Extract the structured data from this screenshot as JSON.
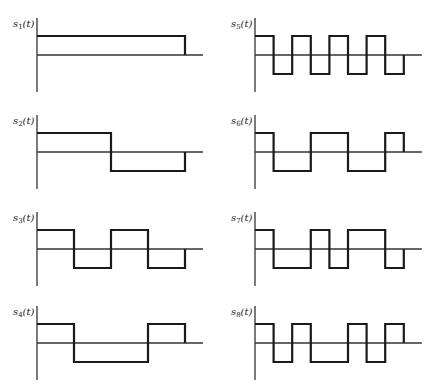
{
  "figure": {
    "slots": 8,
    "panels": [
      {
        "id": "s1",
        "label": "s",
        "subscript": "1",
        "arg": "(t)",
        "levels": [
          1,
          1,
          1,
          1,
          1,
          1,
          1,
          1
        ],
        "col": 0,
        "row": 0
      },
      {
        "id": "s2",
        "label": "s",
        "subscript": "2",
        "arg": "(t)",
        "levels": [
          1,
          1,
          1,
          1,
          -1,
          -1,
          -1,
          -1
        ],
        "col": 0,
        "row": 1
      },
      {
        "id": "s3",
        "label": "s",
        "subscript": "3",
        "arg": "(t)",
        "levels": [
          1,
          1,
          -1,
          -1,
          1,
          1,
          -1,
          -1
        ],
        "col": 0,
        "row": 2
      },
      {
        "id": "s4",
        "label": "s",
        "subscript": "4",
        "arg": "(t)",
        "levels": [
          1,
          1,
          -1,
          -1,
          -1,
          -1,
          1,
          1
        ],
        "col": 0,
        "row": 3
      },
      {
        "id": "s5",
        "label": "s",
        "subscript": "5",
        "arg": "(t)",
        "levels": [
          1,
          -1,
          1,
          -1,
          1,
          -1,
          1,
          -1
        ],
        "col": 1,
        "row": 0
      },
      {
        "id": "s6",
        "label": "s",
        "subscript": "6",
        "arg": "(t)",
        "levels": [
          1,
          -1,
          -1,
          1,
          1,
          -1,
          -1,
          1
        ],
        "col": 1,
        "row": 1
      },
      {
        "id": "s7",
        "label": "s",
        "subscript": "7",
        "arg": "(t)",
        "levels": [
          1,
          -1,
          -1,
          1,
          -1,
          1,
          1,
          -1
        ],
        "col": 1,
        "row": 2
      },
      {
        "id": "s8",
        "label": "s",
        "subscript": "8",
        "arg": "(t)",
        "levels": [
          1,
          -1,
          1,
          -1,
          -1,
          1,
          -1,
          1
        ],
        "col": 1,
        "row": 3
      }
    ]
  },
  "colors": {
    "background": "#ffffff",
    "waveform": "#1a1a1a",
    "axis": "#333333",
    "text": "#222222"
  }
}
